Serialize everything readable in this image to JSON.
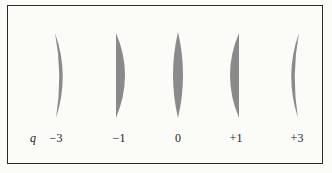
{
  "diagram": {
    "variable_label": "q",
    "fill_color": "#8a8a8a",
    "frame_color": "#2a2a2a",
    "lenses": [
      {
        "q_label": "−3",
        "shape": "meniscus-concave-right",
        "x": 59
      },
      {
        "q_label": "−1",
        "shape": "plano-convex-flat-left",
        "x": 119
      },
      {
        "q_label": "0",
        "shape": "equi-biconvex",
        "x": 178
      },
      {
        "q_label": "+1",
        "shape": "plano-convex-flat-right",
        "x": 236
      },
      {
        "q_label": "+3",
        "shape": "meniscus-concave-left",
        "x": 297
      }
    ]
  }
}
